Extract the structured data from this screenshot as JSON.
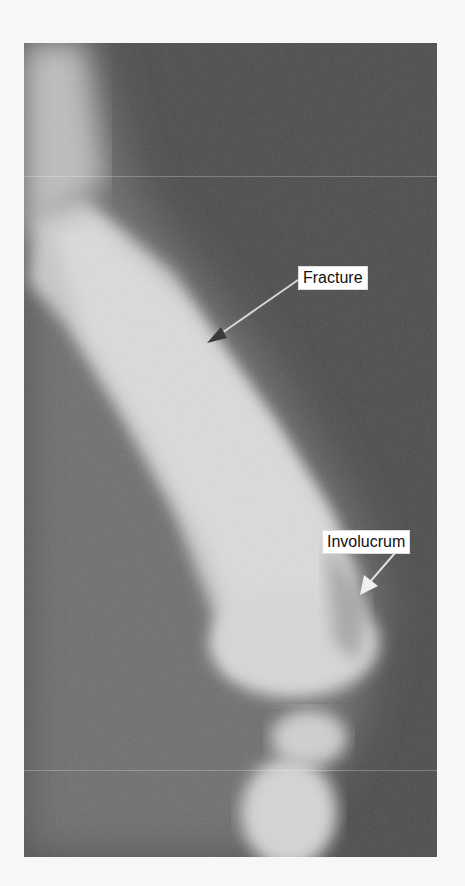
{
  "figure": {
    "type": "radiograph",
    "annotations": [
      {
        "id": "fracture",
        "label": "Fracture"
      },
      {
        "id": "involucrum",
        "label": "Involucrum"
      }
    ]
  }
}
